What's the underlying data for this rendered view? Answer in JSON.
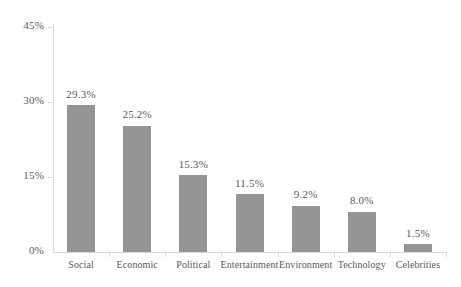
{
  "chart_data": {
    "type": "bar",
    "title": "",
    "subtitle": "",
    "xlabel": "",
    "ylabel": "",
    "categories": [
      "Social",
      "Economic",
      "Political",
      "Entertainment",
      "Environment",
      "Technology",
      "Celebrities"
    ],
    "values": [
      29.3,
      25.2,
      15.3,
      11.5,
      9.2,
      8.0,
      1.5
    ],
    "value_labels": [
      "29.3%",
      "25.2%",
      "15.3%",
      "11.5%",
      "9.2%",
      "8.0%",
      "1.5%"
    ],
    "ylim": [
      0,
      45
    ],
    "y_ticks": [
      0,
      15,
      30,
      45
    ],
    "y_tick_labels": [
      "0%",
      "15%",
      "30%",
      "45%"
    ],
    "grid": false,
    "legend": null,
    "series": [
      {
        "name": "",
        "values": [
          29.3,
          25.2,
          15.3,
          11.5,
          9.2,
          8.0,
          1.5
        ]
      }
    ],
    "colors": {
      "bar": "#959595",
      "axis": "#d9d9d9",
      "text": "#5a5a5a",
      "background": "#ffffff"
    }
  },
  "axis": {
    "y_labels": [
      "45%",
      "30%",
      "15%",
      "0%"
    ]
  },
  "bars": [
    {
      "category": "Social",
      "value_label": "29.3%"
    },
    {
      "category": "Economic",
      "value_label": "25.2%"
    },
    {
      "category": "Political",
      "value_label": "15.3%"
    },
    {
      "category": "Entertainment",
      "value_label": "11.5%"
    },
    {
      "category": "Environment",
      "value_label": "9.2%"
    },
    {
      "category": "Technology",
      "value_label": "8.0%"
    },
    {
      "category": "Celebrities",
      "value_label": "1.5%"
    }
  ]
}
